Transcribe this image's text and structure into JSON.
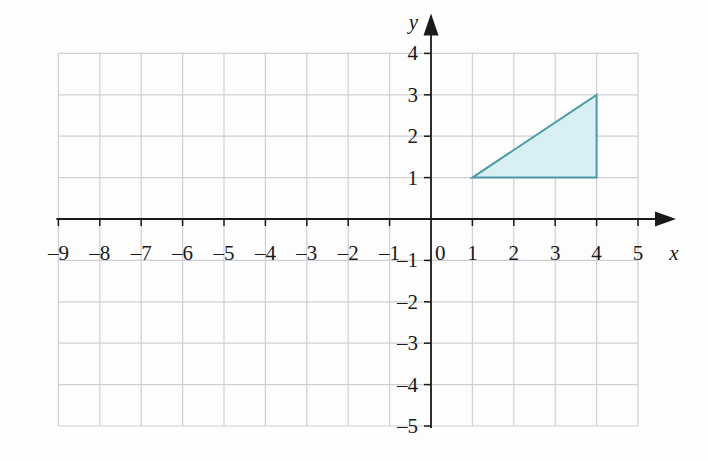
{
  "figure": {
    "background_color": "#fdfdfd",
    "grid_color": "#d0d0d4",
    "axis_color": "#1a1a1a"
  },
  "chart_data": {
    "type": "scatter",
    "title": "",
    "xlabel": "x",
    "ylabel": "y",
    "xlim": [
      -9,
      5
    ],
    "ylim": [
      -5,
      4
    ],
    "grid": true,
    "legend": "none",
    "x_ticks": [
      -9,
      -8,
      -7,
      -6,
      -5,
      -4,
      -3,
      -2,
      -1,
      0,
      1,
      2,
      3,
      4,
      5
    ],
    "y_ticks": [
      4,
      3,
      2,
      1,
      0,
      -1,
      -2,
      -3,
      -4,
      -5
    ],
    "x_tick_labels": [
      "–9",
      "–8",
      "–7",
      "–6",
      "–5",
      "–4",
      "–3",
      "–2",
      "–1",
      "0",
      "1",
      "2",
      "3",
      "4",
      "5"
    ],
    "y_tick_labels": [
      "4",
      "3",
      "2",
      "1",
      "–1",
      "–2",
      "–3",
      "–4",
      "–5"
    ],
    "origin_label": "0",
    "shapes": [
      {
        "name": "triangle",
        "type": "polygon",
        "vertices": [
          [
            1,
            1
          ],
          [
            4,
            1
          ],
          [
            4,
            3
          ]
        ],
        "fill": "#d8f0f4",
        "stroke": "#4f9aa6",
        "stroke_width": 2
      }
    ]
  },
  "axes": {
    "x_name": "x",
    "y_name": "y"
  }
}
